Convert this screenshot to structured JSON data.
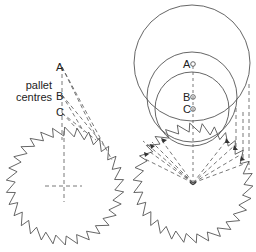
{
  "left_figure": {
    "labels": {
      "a": "A",
      "b": "B",
      "c": "C"
    },
    "caption_line1": "pallet",
    "caption_line2": "centres"
  },
  "right_figure": {
    "labels": {
      "a": "A",
      "b": "B",
      "c": "C"
    }
  },
  "colors": {
    "line": "#555555",
    "fill": "#333333",
    "background": "#ffffff"
  }
}
